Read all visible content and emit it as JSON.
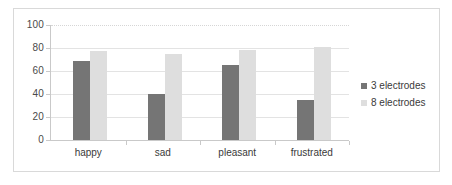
{
  "chart_data": {
    "type": "bar",
    "title": "",
    "subtitle": "",
    "xlabel": "",
    "ylabel": "",
    "categories": [
      "happy",
      "sad",
      "pleasant",
      "frustrated"
    ],
    "series": [
      {
        "name": "3 electrodes",
        "color": "#757575",
        "values": [
          69,
          40,
          65,
          35
        ]
      },
      {
        "name": "8 electrodes",
        "color": "#dedede",
        "values": [
          77,
          75,
          78,
          81
        ]
      }
    ],
    "ylim": [
      0,
      100
    ],
    "yticks": [
      0,
      20,
      40,
      60,
      80,
      100
    ],
    "ytick_labels": [
      "0",
      "20",
      "40",
      "60",
      "80",
      "100"
    ],
    "grid": true,
    "grid_axis": "y",
    "legend_position": "right",
    "legend": [
      "3 electrodes",
      "8 electrodes"
    ]
  },
  "chart": {
    "frame_color": "#d9d9d9",
    "plot_background": "#ffffff",
    "gridline_color": "#e3e3e3",
    "axis_color": "#c9c9c9"
  }
}
